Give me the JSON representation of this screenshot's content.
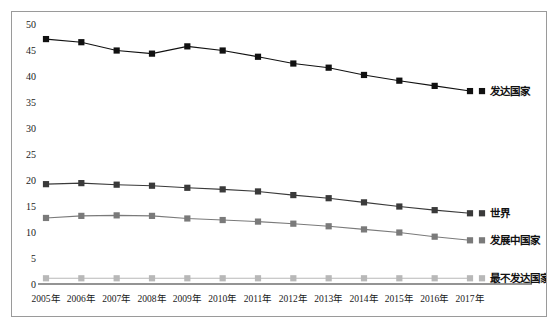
{
  "chart": {
    "title": "",
    "frame_border_color": "#9a9a9a",
    "background": "#ffffff"
  },
  "chart_data": {
    "type": "line",
    "title": "",
    "xlabel": "",
    "ylabel": "",
    "ylim": [
      0,
      50
    ],
    "ytick_step": 5,
    "grid": false,
    "legend_position": "right-inline",
    "categories": [
      "2005年",
      "2006年",
      "2007年",
      "2008年",
      "2009年",
      "2010年",
      "2011年",
      "2012年",
      "2013年",
      "2014年",
      "2015年",
      "2016年",
      "2017年"
    ],
    "yticks": [
      0,
      5,
      10,
      15,
      20,
      25,
      30,
      35,
      40,
      45,
      50
    ],
    "series": [
      {
        "name": "发达国家",
        "color": "#111111",
        "marker": "square",
        "values": [
          47.1,
          46.5,
          44.9,
          44.3,
          45.7,
          44.9,
          43.7,
          42.4,
          41.6,
          40.2,
          39.1,
          38.1,
          37.1
        ]
      },
      {
        "name": "世界",
        "color": "#3a3a3a",
        "marker": "square",
        "values": [
          19.2,
          19.4,
          19.1,
          18.9,
          18.5,
          18.2,
          17.8,
          17.1,
          16.5,
          15.7,
          14.9,
          14.2,
          13.6
        ]
      },
      {
        "name": "发展中国家",
        "color": "#7a7a7a",
        "marker": "square",
        "values": [
          12.7,
          13.1,
          13.2,
          13.1,
          12.6,
          12.3,
          12.0,
          11.6,
          11.1,
          10.5,
          9.9,
          9.1,
          8.4
        ]
      },
      {
        "name": "最不发达国家",
        "color": "#b8b8b8",
        "marker": "square",
        "values": [
          1.1,
          1.1,
          1.1,
          1.1,
          1.1,
          1.1,
          1.1,
          1.1,
          1.1,
          1.1,
          1.1,
          1.1,
          1.1
        ]
      }
    ]
  }
}
